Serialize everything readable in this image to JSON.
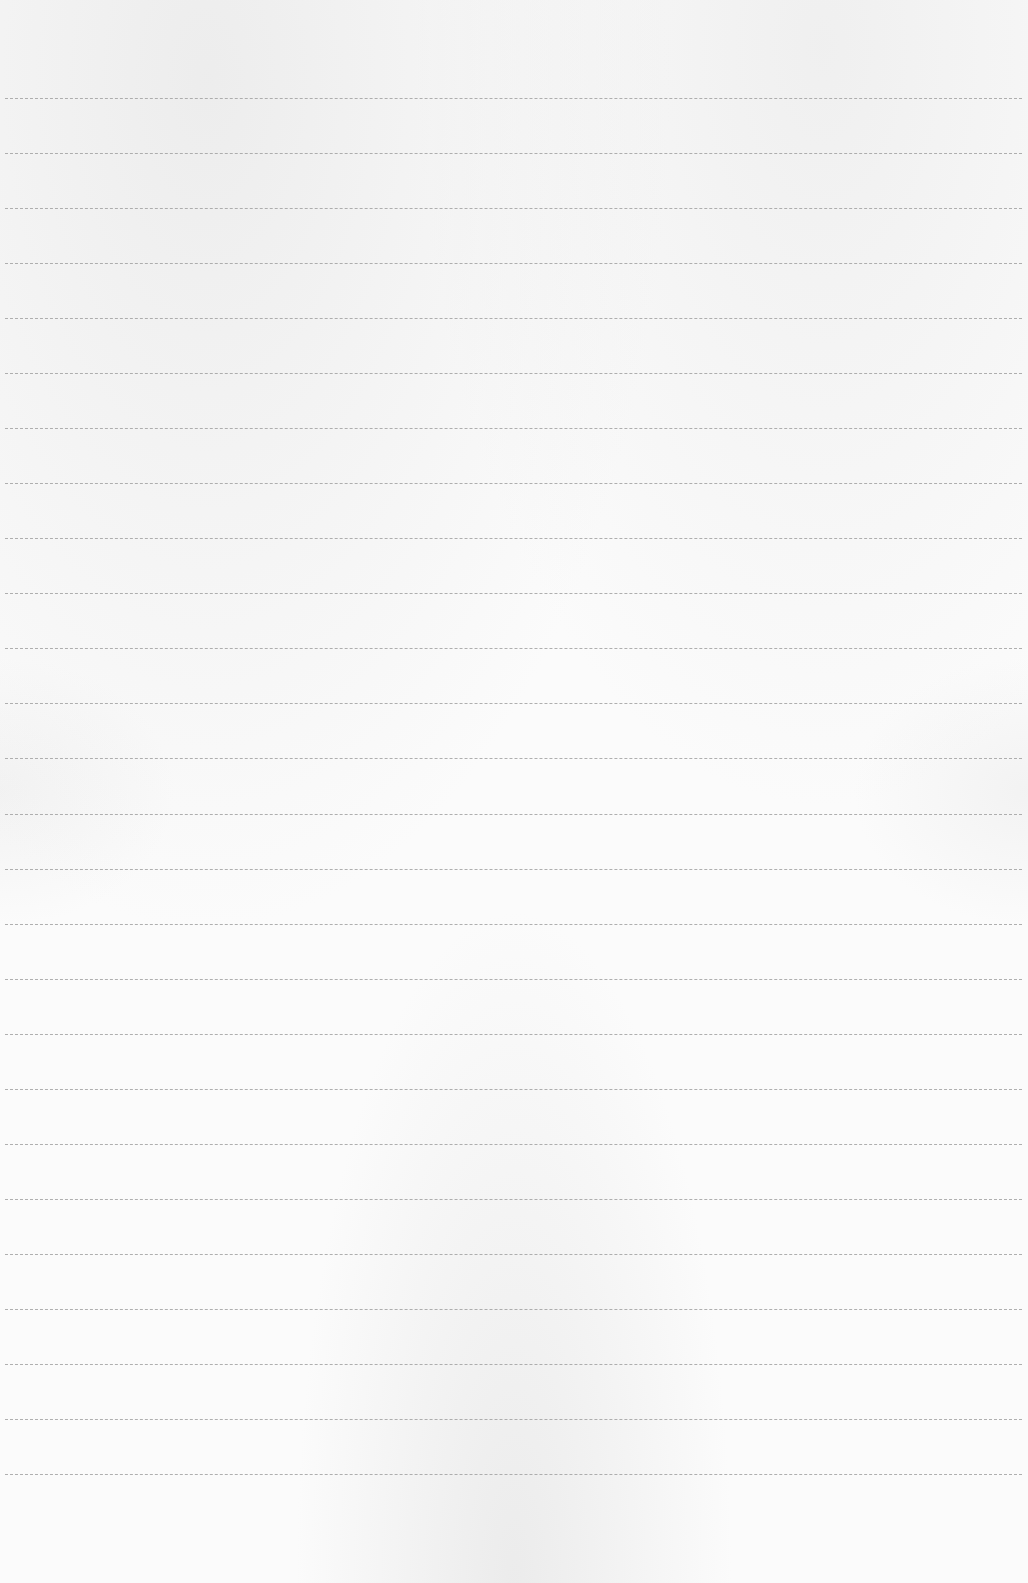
{
  "page": {
    "type": "lined-paper",
    "background_color": "#fbfbfb",
    "line_color": "#a2a2a2",
    "line_count": 26,
    "first_line_y": 98,
    "line_spacing": 55.04,
    "line_left": 5,
    "line_width": 1017,
    "text_content": []
  }
}
